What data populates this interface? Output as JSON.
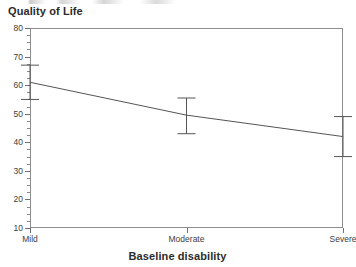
{
  "chart_data": {
    "type": "line",
    "title": "Quality of Life",
    "xlabel": "Baseline disability",
    "ylabel": "",
    "categories": [
      "Mild",
      "Moderate",
      "Severe"
    ],
    "series": [
      {
        "name": "Quality of Life",
        "values": [
          61.0,
          49.5,
          42.0
        ],
        "error_low": [
          55.0,
          43.0,
          35.0
        ],
        "error_high": [
          67.0,
          55.5,
          49.0
        ]
      }
    ],
    "ylim": [
      10,
      80
    ],
    "ytick_values": [
      80,
      70,
      60,
      50,
      40,
      30,
      20,
      10
    ],
    "ytick_labels": [
      "80",
      "70",
      "60",
      "50",
      "40",
      "30",
      "20",
      "10"
    ],
    "yminor_interval": 2.5,
    "grid": false,
    "legend": "none",
    "error_bar_style": "capped-whisker",
    "line_color": "#555555",
    "axis_color": "#8d8d8d"
  },
  "chart": {
    "title": "Quality of Life",
    "axis_title_x": "Baseline disability"
  }
}
